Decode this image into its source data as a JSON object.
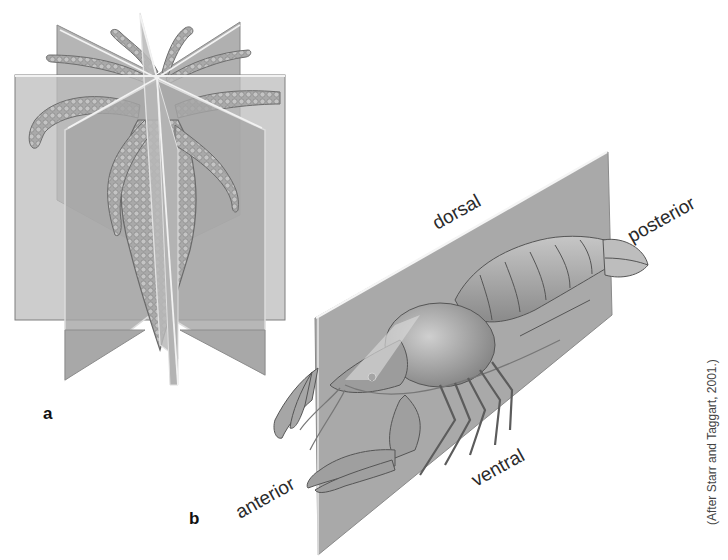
{
  "figure": {
    "panels": [
      {
        "letter": "a",
        "subject": "radially symmetric animal with intersecting planes"
      },
      {
        "letter": "b",
        "subject": "crayfish on single sagittal plane"
      }
    ],
    "labels": {
      "dorsal": "dorsal",
      "posterior": "posterior",
      "anterior": "anterior",
      "ventral": "ventral"
    },
    "credit": "(After Starr and Taggart, 2001.)"
  },
  "colors": {
    "plane_light": "#b9b9b9",
    "plane_mid": "#a4a4a4",
    "plane_dark": "#8f8f8f",
    "body": "#a8a8a8",
    "text": "#2a2a2a"
  }
}
